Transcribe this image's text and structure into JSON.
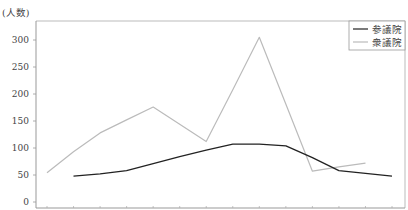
{
  "chart_data": {
    "type": "line",
    "title": "",
    "xlabel": "",
    "ylabel": "(人数)",
    "ylim": [
      -5,
      330
    ],
    "yticks": [
      0,
      50,
      100,
      150,
      200,
      250,
      300
    ],
    "ytick_labels": [
      "0",
      "50",
      "100",
      "150",
      "200",
      "250",
      "300"
    ],
    "x": [
      0,
      1,
      2,
      3,
      4,
      5,
      6,
      7,
      8,
      9,
      10,
      11,
      12,
      13
    ],
    "xtick_labels": [],
    "grid": false,
    "legend_position": "upper right",
    "series": [
      {
        "name": "参議院",
        "color": "#222222",
        "values": [
          null,
          48,
          52,
          58,
          71,
          84,
          96,
          107,
          107,
          104,
          82,
          58,
          53,
          48
        ]
      },
      {
        "name": "衆議院",
        "color": "#bbbbbb",
        "values": [
          54,
          93,
          128,
          152,
          176,
          144,
          112,
          208,
          305,
          181,
          57,
          65,
          72,
          null
        ]
      }
    ]
  }
}
